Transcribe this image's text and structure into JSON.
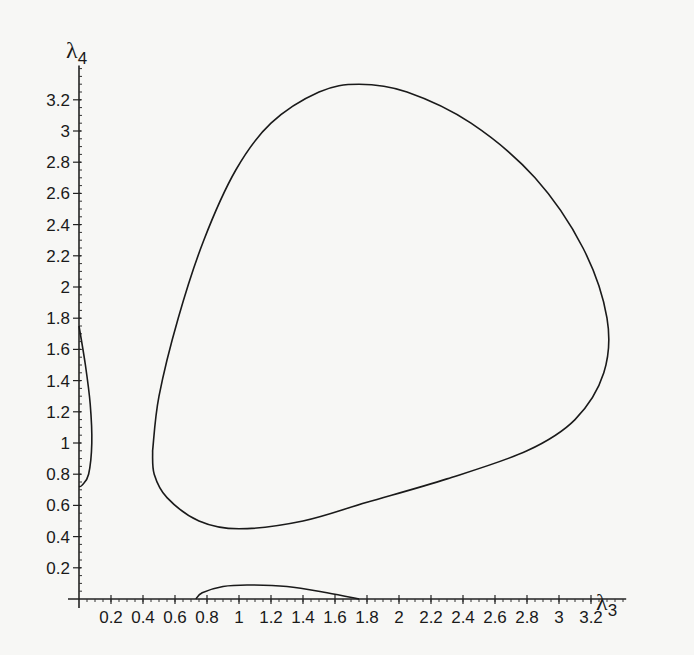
{
  "chart_data": {
    "type": "line",
    "title": "",
    "xlabel": "λ3",
    "ylabel": "λ4",
    "xlim": [
      0,
      3.4
    ],
    "ylim": [
      0,
      3.4
    ],
    "grid": false,
    "legend": null,
    "x_ticks": [
      "0.2",
      "0.4",
      "0.6",
      "0.8",
      "1",
      "1.2",
      "1.4",
      "1.6",
      "1.8",
      "2",
      "2.2",
      "2.4",
      "2.6",
      "2.8",
      "3",
      "3.2"
    ],
    "y_ticks": [
      "0.2",
      "0.4",
      "0.6",
      "0.8",
      "1",
      "1.2",
      "1.4",
      "1.6",
      "1.8",
      "2",
      "2.2",
      "2.4",
      "2.6",
      "2.8",
      "3",
      "3.2"
    ],
    "series": [
      {
        "name": "closed-loop",
        "points": [
          [
            0.46,
            0.95
          ],
          [
            0.5,
            1.3
          ],
          [
            0.62,
            1.8
          ],
          [
            0.78,
            2.3
          ],
          [
            0.98,
            2.75
          ],
          [
            1.2,
            3.05
          ],
          [
            1.5,
            3.25
          ],
          [
            1.75,
            3.3
          ],
          [
            2.05,
            3.25
          ],
          [
            2.45,
            3.05
          ],
          [
            2.85,
            2.7
          ],
          [
            3.15,
            2.25
          ],
          [
            3.3,
            1.8
          ],
          [
            3.28,
            1.45
          ],
          [
            3.1,
            1.15
          ],
          [
            2.8,
            0.95
          ],
          [
            2.3,
            0.77
          ],
          [
            1.8,
            0.62
          ],
          [
            1.4,
            0.5
          ],
          [
            1.0,
            0.45
          ],
          [
            0.75,
            0.5
          ],
          [
            0.55,
            0.65
          ],
          [
            0.47,
            0.8
          ],
          [
            0.46,
            0.95
          ]
        ]
      },
      {
        "name": "left-branch",
        "points": [
          [
            0.0,
            1.75
          ],
          [
            0.04,
            1.5
          ],
          [
            0.07,
            1.25
          ],
          [
            0.08,
            1.0
          ],
          [
            0.06,
            0.8
          ],
          [
            0.02,
            0.73
          ],
          [
            0.0,
            0.72
          ]
        ]
      },
      {
        "name": "bottom-branch",
        "points": [
          [
            0.73,
            0.0
          ],
          [
            0.77,
            0.04
          ],
          [
            0.9,
            0.08
          ],
          [
            1.05,
            0.09
          ],
          [
            1.3,
            0.08
          ],
          [
            1.55,
            0.04
          ],
          [
            1.75,
            0.0
          ]
        ]
      }
    ]
  }
}
